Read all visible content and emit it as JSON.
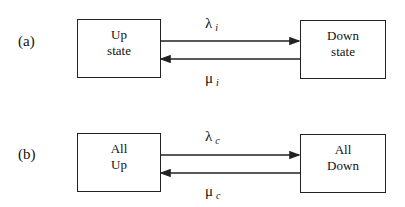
{
  "diagrams": [
    {
      "panel_label": "(a)",
      "left_state": {
        "line1": "Up",
        "line2": "state"
      },
      "right_state": {
        "line1": "Down",
        "line2": "state"
      },
      "forward_rate": {
        "symbol": "λ",
        "subscript": "i"
      },
      "backward_rate": {
        "symbol": "μ",
        "subscript": "i"
      }
    },
    {
      "panel_label": "(b)",
      "left_state": {
        "line1": "All",
        "line2": "Up"
      },
      "right_state": {
        "line1": "All",
        "line2": "Down"
      },
      "forward_rate": {
        "symbol": "λ",
        "subscript": "c"
      },
      "backward_rate": {
        "symbol": "μ",
        "subscript": "c"
      }
    }
  ],
  "colors": {
    "line": "#222222",
    "background": "#ffffff"
  }
}
